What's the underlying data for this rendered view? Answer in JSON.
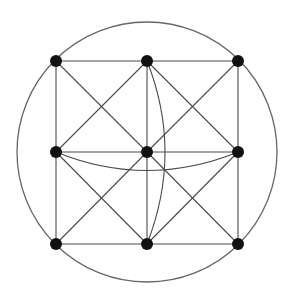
{
  "diagram": {
    "type": "graph",
    "colors": {
      "node": "#111111",
      "edge": "#4a4a4a",
      "circle": "#666666",
      "background": "#ffffff"
    },
    "circle": {
      "cx": 147,
      "cy": 152,
      "r": 130
    },
    "node_radius": 6,
    "nodes": [
      {
        "id": "n00",
        "x": 56,
        "y": 61
      },
      {
        "id": "n01",
        "x": 147,
        "y": 61
      },
      {
        "id": "n02",
        "x": 238,
        "y": 61
      },
      {
        "id": "n10",
        "x": 56,
        "y": 152
      },
      {
        "id": "n11",
        "x": 147,
        "y": 152
      },
      {
        "id": "n12",
        "x": 238,
        "y": 152
      },
      {
        "id": "n20",
        "x": 56,
        "y": 244
      },
      {
        "id": "n21",
        "x": 147,
        "y": 244
      },
      {
        "id": "n22",
        "x": 238,
        "y": 244
      }
    ],
    "edges": [
      [
        "n00",
        "n01"
      ],
      [
        "n01",
        "n02"
      ],
      [
        "n10",
        "n11"
      ],
      [
        "n11",
        "n12"
      ],
      [
        "n20",
        "n21"
      ],
      [
        "n21",
        "n22"
      ],
      [
        "n00",
        "n10"
      ],
      [
        "n10",
        "n20"
      ],
      [
        "n01",
        "n11"
      ],
      [
        "n11",
        "n21"
      ],
      [
        "n02",
        "n12"
      ],
      [
        "n12",
        "n22"
      ],
      [
        "n00",
        "n11"
      ],
      [
        "n01",
        "n10"
      ],
      [
        "n01",
        "n12"
      ],
      [
        "n02",
        "n11"
      ],
      [
        "n10",
        "n21"
      ],
      [
        "n11",
        "n20"
      ],
      [
        "n11",
        "n22"
      ],
      [
        "n12",
        "n21"
      ]
    ],
    "arcs": [
      {
        "from": "n01",
        "to": "n21",
        "bulge": "right",
        "control": [
          183,
          152
        ]
      },
      {
        "from": "n10",
        "to": "n12",
        "bulge": "down",
        "control": [
          147,
          189
        ]
      }
    ]
  }
}
